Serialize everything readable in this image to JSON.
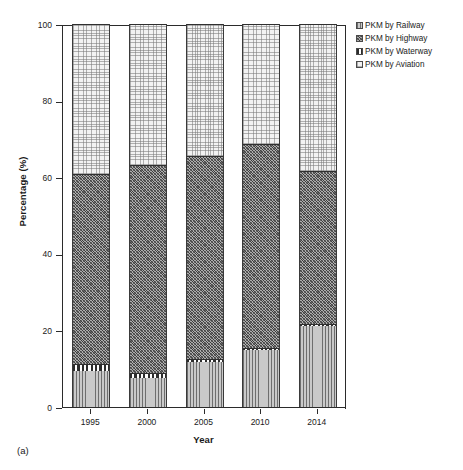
{
  "panel_caption": "(a)",
  "legend": {
    "position": "top-right",
    "entries": [
      {
        "label": "PKM by Railway",
        "swatch": "vertical-lines-pattern"
      },
      {
        "label": "PKM by Highway",
        "swatch": "diagonal-cross-pattern"
      },
      {
        "label": "PKM by Waterway",
        "swatch": "checkerboard-pattern"
      },
      {
        "label": "PKM by Aviation",
        "swatch": "light-dot-pattern"
      }
    ]
  },
  "axes": {
    "y_title": "Percentage (%)",
    "x_title": "Year",
    "y_ticks": [
      "0",
      "20",
      "40",
      "60",
      "80",
      "100"
    ],
    "x_ticks": [
      "1995",
      "2000",
      "2005",
      "2010",
      "2014"
    ]
  },
  "chart_data": {
    "type": "bar",
    "subtype": "stacked-100-percent",
    "title": "",
    "subtitle": "",
    "xlabel": "Year",
    "ylabel": "Percentage (%)",
    "ylim": [
      0,
      100
    ],
    "ytick_interval": 20,
    "grid": false,
    "legend_position": "top-right",
    "categories": [
      "1995",
      "2000",
      "2005",
      "2010",
      "2014"
    ],
    "series": [
      {
        "name": "PKM by Railway",
        "values": [
          9.4,
          7.6,
          11.7,
          14.9,
          21.1
        ]
      },
      {
        "name": "PKM by Waterway",
        "values": [
          1.8,
          1.3,
          0.8,
          0.5,
          0.6
        ]
      },
      {
        "name": "PKM by Highway",
        "values": [
          49.6,
          54.3,
          53.0,
          53.3,
          39.9
        ]
      },
      {
        "name": "PKM by Aviation",
        "values": [
          39.2,
          36.8,
          34.5,
          31.3,
          38.4
        ]
      }
    ],
    "stack_order_bottom_to_top": [
      "PKM by Railway",
      "PKM by Waterway",
      "PKM by Highway",
      "PKM by Aviation"
    ],
    "cumulative_tops": {
      "1995": {
        "railway": 9.4,
        "waterway": 11.2,
        "highway": 60.8,
        "aviation": 100
      },
      "2000": {
        "railway": 7.6,
        "waterway": 8.9,
        "highway": 63.2,
        "aviation": 100
      },
      "2005": {
        "railway": 11.7,
        "waterway": 12.5,
        "highway": 65.5,
        "aviation": 100
      },
      "2010": {
        "railway": 14.9,
        "waterway": 15.4,
        "highway": 68.7,
        "aviation": 100
      },
      "2014": {
        "railway": 21.1,
        "waterway": 21.7,
        "highway": 61.6,
        "aviation": 100
      }
    },
    "annotations": [
      "(a)"
    ]
  }
}
